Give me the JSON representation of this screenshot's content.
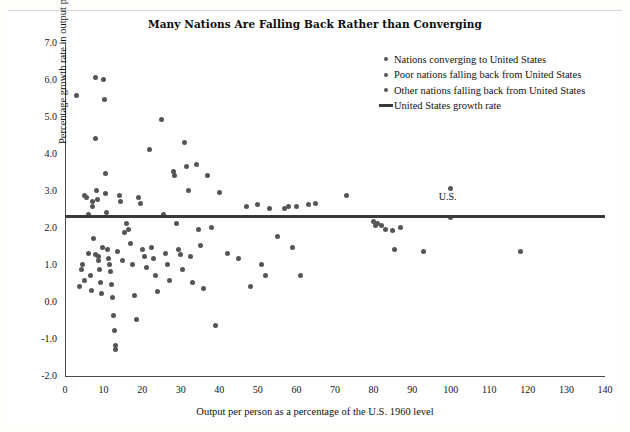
{
  "title": "Many Nations Are Falling Back Rather than Converging",
  "colors": {
    "marker": "#555555",
    "line": "#3a3a3a",
    "axis": "#4a4a4a",
    "text": "#111111",
    "background": "#ffffff"
  },
  "axes": {
    "x_title": "Output per person as a percentage of the U.S. 1960 level",
    "y_title": "Percentage growth rate in output per person",
    "x_ticks": [
      "0",
      "10",
      "20",
      "30",
      "40",
      "50",
      "60",
      "70",
      "80",
      "90",
      "100",
      "110",
      "120",
      "130",
      "140"
    ],
    "y_ticks": [
      "7.0",
      "6.0",
      "5.0",
      "4.0",
      "3.0",
      "2.0",
      "1.0",
      "0.0",
      "-1.0",
      "-2.0"
    ]
  },
  "legend": {
    "items": [
      {
        "marker": "dot",
        "label": "Nations converging to United States"
      },
      {
        "marker": "dot",
        "label": "Poor nations falling back from United States"
      },
      {
        "marker": "dot",
        "label": "Other nations falling back from United States"
      },
      {
        "marker": "line",
        "label": "United States growth rate"
      }
    ]
  },
  "annotations": [
    {
      "name": "us-label",
      "text": "U.S.",
      "x": 100,
      "y": 2.85
    }
  ],
  "chart_data": {
    "type": "scatter",
    "title": "Many Nations Are Falling Back Rather than Converging",
    "xlabel": "Output per person as a percentage of the U.S. 1960 level",
    "ylabel": "Percentage growth rate in output per person",
    "xlim": [
      0,
      140
    ],
    "ylim": [
      -2.0,
      7.0
    ],
    "xtick_step": 10,
    "ytick_step": 1.0,
    "grid": false,
    "legend_position": "top-right",
    "reference_line": {
      "name": "United States growth rate",
      "orientation": "horizontal",
      "value": 2.35
    },
    "series": [
      {
        "name": "Nations (all categories share one marker style)",
        "points": [
          [
            3.0,
            5.6
          ],
          [
            5.0,
            2.9
          ],
          [
            5.5,
            2.85
          ],
          [
            4.5,
            1.05
          ],
          [
            5.0,
            0.6
          ],
          [
            3.8,
            0.45
          ],
          [
            4.2,
            0.9
          ],
          [
            6.0,
            2.4
          ],
          [
            6.2,
            1.35
          ],
          [
            6.5,
            0.75
          ],
          [
            6.8,
            0.35
          ],
          [
            7.0,
            2.75
          ],
          [
            7.2,
            2.6
          ],
          [
            7.5,
            1.75
          ],
          [
            7.8,
            1.3
          ],
          [
            8.0,
            6.1
          ],
          [
            8.0,
            4.45
          ],
          [
            8.2,
            3.05
          ],
          [
            8.5,
            2.8
          ],
          [
            8.6,
            1.25
          ],
          [
            8.8,
            1.15
          ],
          [
            9.0,
            0.9
          ],
          [
            9.2,
            0.55
          ],
          [
            9.4,
            0.25
          ],
          [
            9.6,
            1.5
          ],
          [
            10.0,
            6.05
          ],
          [
            10.2,
            5.5
          ],
          [
            10.5,
            3.5
          ],
          [
            10.6,
            2.95
          ],
          [
            10.8,
            2.45
          ],
          [
            11.0,
            1.45
          ],
          [
            11.2,
            1.2
          ],
          [
            11.5,
            1.05
          ],
          [
            11.8,
            0.85
          ],
          [
            12.0,
            0.5
          ],
          [
            12.2,
            0.15
          ],
          [
            12.5,
            -0.35
          ],
          [
            12.8,
            -0.75
          ],
          [
            13.0,
            -1.15
          ],
          [
            13.2,
            -1.25
          ],
          [
            13.5,
            1.4
          ],
          [
            14.0,
            2.9
          ],
          [
            14.5,
            2.75
          ],
          [
            15.0,
            1.15
          ],
          [
            15.5,
            1.9
          ],
          [
            16.0,
            2.15
          ],
          [
            16.5,
            2.0
          ],
          [
            17.0,
            1.6
          ],
          [
            17.5,
            1.05
          ],
          [
            18.0,
            0.2
          ],
          [
            18.5,
            -0.45
          ],
          [
            19.0,
            2.85
          ],
          [
            19.5,
            2.7
          ],
          [
            20.0,
            1.45
          ],
          [
            20.5,
            1.25
          ],
          [
            21.0,
            0.95
          ],
          [
            22.0,
            4.15
          ],
          [
            22.5,
            1.5
          ],
          [
            23.0,
            1.2
          ],
          [
            23.5,
            0.75
          ],
          [
            24.0,
            0.3
          ],
          [
            25.0,
            4.95
          ],
          [
            25.5,
            2.4
          ],
          [
            26.0,
            1.35
          ],
          [
            26.5,
            1.05
          ],
          [
            27.0,
            0.6
          ],
          [
            28.0,
            3.55
          ],
          [
            28.5,
            3.45
          ],
          [
            29.0,
            2.15
          ],
          [
            29.5,
            1.45
          ],
          [
            30.0,
            1.3
          ],
          [
            30.5,
            0.9
          ],
          [
            31.0,
            4.35
          ],
          [
            31.5,
            3.7
          ],
          [
            32.0,
            3.05
          ],
          [
            32.5,
            1.25
          ],
          [
            33.0,
            0.55
          ],
          [
            34.0,
            3.75
          ],
          [
            34.5,
            2.0
          ],
          [
            35.0,
            1.55
          ],
          [
            36.0,
            0.4
          ],
          [
            37.0,
            3.45
          ],
          [
            38.0,
            2.05
          ],
          [
            39.0,
            -0.6
          ],
          [
            40.0,
            3.0
          ],
          [
            42.0,
            1.35
          ],
          [
            45.0,
            1.2
          ],
          [
            47.0,
            2.6
          ],
          [
            48.0,
            0.45
          ],
          [
            50.0,
            2.65
          ],
          [
            51.0,
            1.05
          ],
          [
            52.0,
            0.75
          ],
          [
            53.0,
            2.55
          ],
          [
            55.0,
            1.8
          ],
          [
            57.0,
            2.55
          ],
          [
            58.0,
            2.6
          ],
          [
            59.0,
            1.5
          ],
          [
            60.0,
            2.6
          ],
          [
            61.0,
            0.75
          ],
          [
            63.0,
            2.65
          ],
          [
            65.0,
            2.7
          ],
          [
            73.0,
            2.9
          ],
          [
            80.0,
            2.2
          ],
          [
            80.5,
            2.1
          ],
          [
            81.0,
            2.15
          ],
          [
            82.0,
            2.1
          ],
          [
            83.0,
            2.0
          ],
          [
            85.0,
            1.95
          ],
          [
            87.0,
            2.05
          ],
          [
            85.5,
            1.45
          ],
          [
            93.0,
            1.4
          ],
          [
            100.0,
            3.1
          ],
          [
            100.0,
            2.3
          ],
          [
            118.0,
            1.4
          ]
        ]
      }
    ]
  }
}
